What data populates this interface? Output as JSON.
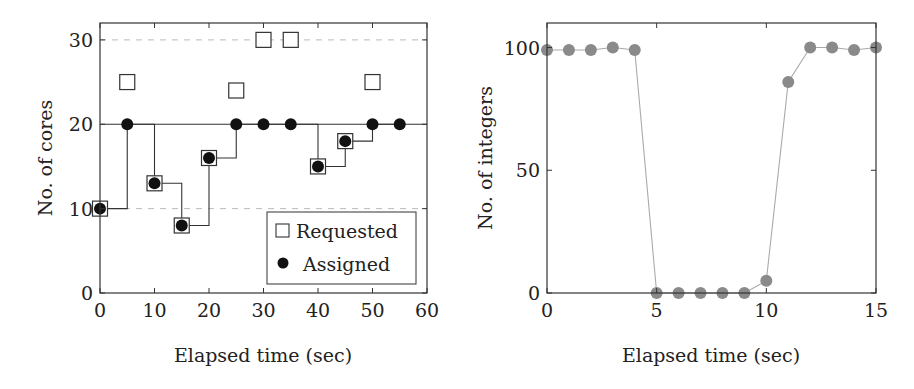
{
  "chart_data": [
    {
      "type": "scatter",
      "title": "",
      "xlabel": "Elapsed time (sec)",
      "ylabel": "No. of cores",
      "xlim": [
        0,
        60
      ],
      "ylim": [
        0,
        32
      ],
      "xticks": [
        0,
        10,
        20,
        30,
        40,
        50,
        60
      ],
      "yticks": [
        0,
        10,
        20,
        30
      ],
      "grid": "dashed horizontal at 10 and 30; solid capacity line at 20",
      "legend_position": "lower right",
      "series": [
        {
          "name": "Requested",
          "marker": "open-square",
          "x": [
            0,
            5,
            10,
            15,
            20,
            25,
            30,
            35,
            40,
            45,
            50
          ],
          "values": [
            10,
            25,
            13,
            8,
            16,
            24,
            30,
            30,
            15,
            18,
            25
          ]
        },
        {
          "name": "Assigned",
          "marker": "filled-circle",
          "line": "step",
          "x": [
            0,
            5,
            10,
            15,
            20,
            25,
            30,
            35,
            40,
            45,
            50,
            55
          ],
          "values": [
            10,
            20,
            13,
            8,
            16,
            20,
            20,
            20,
            15,
            18,
            20,
            20
          ]
        }
      ]
    },
    {
      "type": "line",
      "title": "",
      "xlabel": "Elapsed time (sec)",
      "ylabel": "No. of integers",
      "xlim": [
        0,
        15
      ],
      "ylim": [
        0,
        110
      ],
      "xticks": [
        0,
        5,
        10,
        15
      ],
      "yticks": [
        0,
        50,
        100
      ],
      "grid": "off",
      "series": [
        {
          "name": "integers",
          "marker": "filled-circle",
          "color": "#8a8a8a",
          "x": [
            0,
            1,
            2,
            3,
            4,
            5,
            6,
            7,
            8,
            9,
            10,
            11,
            12,
            13,
            14,
            15
          ],
          "values": [
            99,
            99,
            99,
            100,
            99,
            0,
            0,
            0,
            0,
            0,
            5,
            86,
            100,
            100,
            99,
            100
          ]
        }
      ]
    }
  ],
  "left": {
    "xlabel": "Elapsed time (sec)",
    "ylabel": "No. of cores",
    "xticks": [
      "0",
      "10",
      "20",
      "30",
      "40",
      "50",
      "60"
    ],
    "yticks": [
      "0",
      "10",
      "20",
      "30"
    ],
    "legend": {
      "requested": "Requested",
      "assigned": "Assigned"
    }
  },
  "right": {
    "xlabel": "Elapsed time (sec)",
    "ylabel": "No. of integers",
    "xticks": [
      "0",
      "5",
      "10",
      "15"
    ],
    "yticks": [
      "0",
      "50",
      "100"
    ]
  },
  "colors": {
    "axis": "#333333",
    "grid": "#bbbbbb",
    "assigned": "#111111",
    "requested_stroke": "#333333",
    "right_marker": "#8a8a8a",
    "right_line": "#aaaaaa"
  }
}
